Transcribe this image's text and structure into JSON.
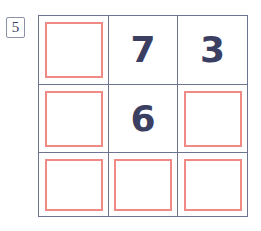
{
  "badge": {
    "label": "5"
  },
  "grid": {
    "rows": 3,
    "cols": 3,
    "border_color": "#6e738f",
    "placeholder_color": "#ef8a85",
    "digit_color": "#3b4062",
    "background_color": "#ffffff",
    "cells": [
      {
        "id": "r1c1",
        "type": "placeholder",
        "value": ""
      },
      {
        "id": "r1c2",
        "type": "digit",
        "value": "7"
      },
      {
        "id": "r1c3",
        "type": "digit",
        "value": "3"
      },
      {
        "id": "r2c1",
        "type": "placeholder",
        "value": ""
      },
      {
        "id": "r2c2",
        "type": "digit",
        "value": "6"
      },
      {
        "id": "r2c3",
        "type": "placeholder",
        "value": ""
      },
      {
        "id": "r3c1",
        "type": "placeholder",
        "value": ""
      },
      {
        "id": "r3c2",
        "type": "placeholder",
        "value": ""
      },
      {
        "id": "r3c3",
        "type": "placeholder",
        "value": ""
      }
    ]
  }
}
